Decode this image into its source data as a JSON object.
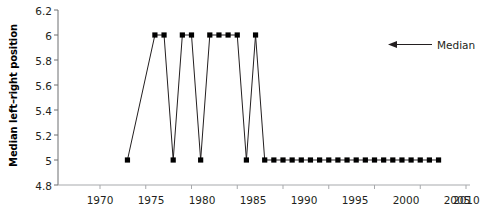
{
  "chart_data": {
    "type": "line",
    "title": "",
    "xlabel": "",
    "ylabel": "Median left–right position",
    "xlim": [
      1970,
      2010
    ],
    "ylim": [
      4.8,
      6.2
    ],
    "grid": false,
    "xticks": [
      1970,
      1975,
      1980,
      1985,
      1990,
      1995,
      2000,
      2005,
      2010
    ],
    "xticklabels": [
      "1970",
      "1975",
      "1980",
      "1985",
      "1990",
      "1995",
      "2000",
      "2005",
      "2010"
    ],
    "yticks": [
      4.8,
      5,
      5.2,
      5.4,
      5.6,
      5.8,
      6,
      6.2
    ],
    "yticklabels": [
      "4.8",
      "5",
      "5.2",
      "5.4",
      "5.6",
      "5.8",
      "6",
      "6.2"
    ],
    "marker": "square",
    "marker_color": "#000000",
    "line_color": "#231f20",
    "series": [
      {
        "name": "Median",
        "x": [
          1973,
          1976,
          1977,
          1978,
          1979,
          1980,
          1981,
          1982,
          1983,
          1984,
          1985,
          1986,
          1987,
          1988,
          1989,
          1990,
          1991,
          1992,
          1993,
          1994,
          1995,
          1996,
          1997,
          1998,
          1999,
          2000,
          2001,
          2002,
          2003,
          2004,
          2005,
          2006,
          2007
        ],
        "values": [
          5,
          6,
          6,
          5,
          6,
          6,
          5,
          6,
          6,
          6,
          6,
          5,
          6,
          5,
          5,
          5,
          5,
          5,
          5,
          5,
          5,
          5,
          5,
          5,
          5,
          5,
          5,
          5,
          5,
          5,
          5,
          5,
          5
        ]
      }
    ],
    "annotations": [
      {
        "label": "Median",
        "type": "arrow-left",
        "arrow_color": "#231f20"
      }
    ]
  }
}
